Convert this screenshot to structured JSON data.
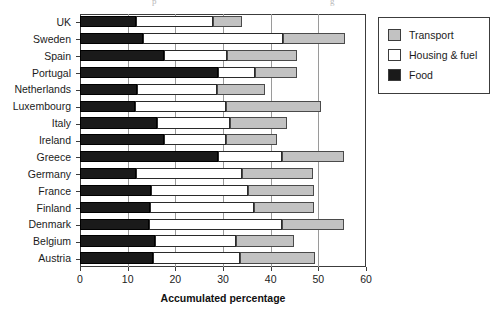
{
  "artifacts": {
    "left": "p",
    "right": "g"
  },
  "legend": {
    "position": "top-right",
    "items": [
      {
        "label": "Transport",
        "color": "#c2c2c2",
        "icon": "square-swatch-icon"
      },
      {
        "label": "Housing & fuel",
        "color": "#ffffff",
        "icon": "square-swatch-icon"
      },
      {
        "label": "Food",
        "color": "#1a1a1a",
        "icon": "square-swatch-icon"
      }
    ]
  },
  "axis": {
    "x_title": "Accumulated percentage",
    "x_ticks": [
      0,
      10,
      20,
      30,
      40,
      50,
      60
    ],
    "x_tick_labels": [
      "0",
      "10",
      "20",
      "30",
      "40",
      "50",
      "60"
    ],
    "x_min": 0,
    "x_max": 60,
    "grid": "vertical"
  },
  "chart_data": {
    "type": "bar",
    "orientation": "horizontal",
    "stacked": true,
    "title": "",
    "subtitle": "",
    "xlabel": "Accumulated percentage",
    "ylabel": "",
    "xlim": [
      0,
      60
    ],
    "grid": true,
    "legend_position": "top-right",
    "categories": [
      "UK",
      "Sweden",
      "Spain",
      "Portugal",
      "Netherlands",
      "Luxembourg",
      "Italy",
      "Ireland",
      "Greece",
      "Germany",
      "France",
      "Finland",
      "Denmark",
      "Belgium",
      "Austria"
    ],
    "series": [
      {
        "name": "Food",
        "color": "#1a1a1a",
        "values": [
          11.7,
          13.2,
          17.6,
          29.0,
          12.0,
          11.5,
          16.2,
          17.6,
          29.0,
          11.7,
          14.9,
          14.7,
          14.5,
          15.7,
          15.3
        ]
      },
      {
        "name": "Housing & fuel",
        "color": "#ffffff",
        "values": [
          16.3,
          29.3,
          13.2,
          7.7,
          16.7,
          19.1,
          15.3,
          13.0,
          13.3,
          22.3,
          20.3,
          21.8,
          27.8,
          17.0,
          18.2
        ]
      },
      {
        "name": "Transport",
        "color": "#c2c2c2",
        "values": [
          6.0,
          13.0,
          14.7,
          8.8,
          10.1,
          19.9,
          11.9,
          10.7,
          13.0,
          14.8,
          13.8,
          12.5,
          13.0,
          12.2,
          15.8
        ]
      }
    ],
    "cumulative_endpoints": [
      {
        "category": "UK",
        "food": 11.7,
        "food_plus_housing": 28.0,
        "total": 34.0
      },
      {
        "category": "Sweden",
        "food": 13.2,
        "food_plus_housing": 42.5,
        "total": 55.5
      },
      {
        "category": "Spain",
        "food": 17.6,
        "food_plus_housing": 30.8,
        "total": 45.5
      },
      {
        "category": "Portugal",
        "food": 29.0,
        "food_plus_housing": 36.7,
        "total": 45.5
      },
      {
        "category": "Netherlands",
        "food": 12.0,
        "food_plus_housing": 28.7,
        "total": 38.8
      },
      {
        "category": "Luxembourg",
        "food": 11.5,
        "food_plus_housing": 30.6,
        "total": 50.5
      },
      {
        "category": "Italy",
        "food": 16.2,
        "food_plus_housing": 31.5,
        "total": 43.4
      },
      {
        "category": "Ireland",
        "food": 17.6,
        "food_plus_housing": 30.6,
        "total": 41.3
      },
      {
        "category": "Greece",
        "food": 29.0,
        "food_plus_housing": 42.3,
        "total": 55.3
      },
      {
        "category": "Germany",
        "food": 11.7,
        "food_plus_housing": 34.0,
        "total": 48.8
      },
      {
        "category": "France",
        "food": 14.9,
        "food_plus_housing": 35.2,
        "total": 49.0
      },
      {
        "category": "Finland",
        "food": 14.7,
        "food_plus_housing": 36.5,
        "total": 49.0
      },
      {
        "category": "Denmark",
        "food": 14.5,
        "food_plus_housing": 42.3,
        "total": 55.3
      },
      {
        "category": "Belgium",
        "food": 15.7,
        "food_plus_housing": 32.7,
        "total": 44.9
      },
      {
        "category": "Austria",
        "food": 15.3,
        "food_plus_housing": 33.5,
        "total": 49.3
      }
    ]
  }
}
